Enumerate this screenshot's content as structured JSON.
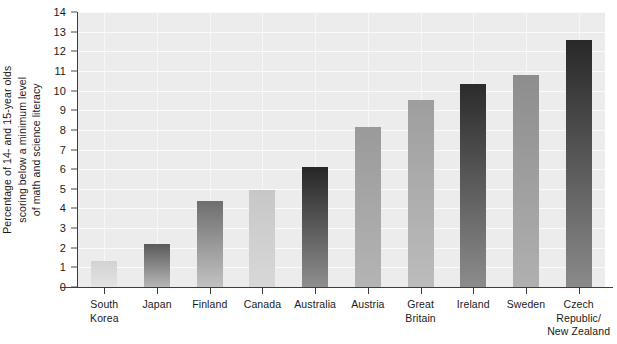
{
  "chart_data": {
    "type": "bar",
    "title": "",
    "subtitle": "",
    "xlabel": "",
    "ylabel": "Percentage of 14- and 15-year olds scoring below a minimum level of math and science literacy",
    "ylabel_lines": [
      "Percentage of 14- and 15-year olds",
      "scoring below a minimum level",
      "of math and science literacy"
    ],
    "categories": [
      "South Korea",
      "Japan",
      "Finland",
      "Canada",
      "Australia",
      "Austria",
      "Great Britain",
      "Ireland",
      "Sweden",
      "Czech Republic/New Zealand"
    ],
    "category_lines": [
      [
        "South",
        "Korea"
      ],
      [
        "Japan"
      ],
      [
        "Finland"
      ],
      [
        "Canada"
      ],
      [
        "Australia"
      ],
      [
        "Austria"
      ],
      [
        "Great",
        "Britain"
      ],
      [
        "Ireland"
      ],
      [
        "Sweden"
      ],
      [
        "Czech",
        "Republic/",
        "New Zealand"
      ]
    ],
    "values": [
      1.3,
      2.2,
      4.4,
      4.95,
      6.1,
      8.15,
      9.5,
      10.35,
      10.8,
      12.55
    ],
    "ylim": [
      0,
      14
    ],
    "ytick_values": [
      0,
      1,
      2,
      3,
      4,
      5,
      6,
      7,
      8,
      9,
      10,
      11,
      12,
      13,
      14
    ],
    "ytick_labels": [
      "0",
      "1",
      "2",
      "3",
      "4",
      "5",
      "6",
      "7",
      "8",
      "9",
      "10",
      "11",
      "12",
      "13",
      "14"
    ],
    "grid": true,
    "legend": null,
    "bar_gradients": [
      {
        "top": "#d2d2d2",
        "bottom": "#e4e4e4"
      },
      {
        "top": "#5a5a5a",
        "bottom": "#b6b6b6"
      },
      {
        "top": "#6e6e6e",
        "bottom": "#c2c2c2"
      },
      {
        "top": "#c7c7c7",
        "bottom": "#d8d8d8"
      },
      {
        "top": "#262626",
        "bottom": "#8f8f8f"
      },
      {
        "top": "#9a9a9a",
        "bottom": "#b4b4b4"
      },
      {
        "top": "#9e9e9e",
        "bottom": "#bcbcbc"
      },
      {
        "top": "#2b2b2b",
        "bottom": "#8c8c8c"
      },
      {
        "top": "#8d8d8d",
        "bottom": "#b0b0b0"
      },
      {
        "top": "#282828",
        "bottom": "#8a8a8a"
      }
    ],
    "plot_background": "#ececec",
    "gridline_color": "#fbfbfb",
    "axis_color": "#3d3d3d",
    "text_color": "#1a1a1a"
  }
}
